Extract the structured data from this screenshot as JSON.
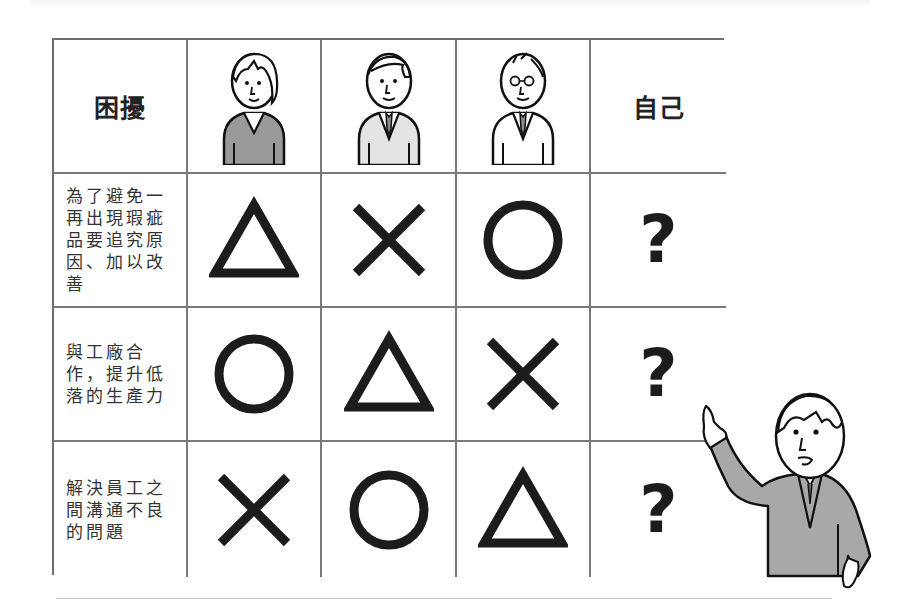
{
  "header": {
    "corner_label": "困擾",
    "person_columns": [
      {
        "icon": "woman-dark-sweater-avatar"
      },
      {
        "icon": "man-light-vest-avatar"
      },
      {
        "icon": "man-glasses-shirt-avatar"
      }
    ],
    "self_label": "自己"
  },
  "rows": [
    {
      "label": "為了避免一再出現瑕疵品要追究原因、加以改善",
      "marks": [
        "triangle",
        "cross",
        "circle"
      ],
      "self_mark": "?"
    },
    {
      "label": "與工廠合作，提升低落的生產力",
      "marks": [
        "circle",
        "triangle",
        "cross"
      ],
      "self_mark": "?"
    },
    {
      "label": "解決員工之間溝通不良的問題",
      "marks": [
        "cross",
        "circle",
        "triangle"
      ],
      "self_mark": "?"
    }
  ],
  "legend_semantics": {
    "circle": "good",
    "triangle": "fair",
    "cross": "poor",
    "question": "unknown"
  },
  "colors": {
    "grid_line": "#7a7a7a",
    "mark": "#1c1c1c",
    "figure_fill_dark": "#9a9a9a",
    "figure_fill_light": "#e4e4e4"
  },
  "illustration": {
    "presenter": "man-pointing-at-table"
  }
}
